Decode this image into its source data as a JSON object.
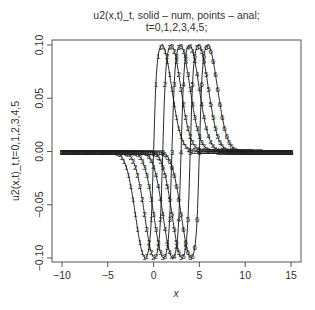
{
  "chart_data": {
    "type": "line",
    "title": "u2(x,t)_t, solid – num, points – anal;",
    "subtitle": "t=0,1,2,3,4,5;",
    "xlabel": "x",
    "ylabel": "u2(x,t)_t,t=0,1,2,3,4,5",
    "xlim": [
      -11.1,
      16.1
    ],
    "ylim": [
      -0.105,
      0.105
    ],
    "xticks": [
      -10,
      -5,
      0,
      5,
      10,
      15
    ],
    "xtick_labels": [
      "−10",
      "−5",
      "0",
      "5",
      "10",
      "15"
    ],
    "yticks": [
      0.1,
      0.05,
      0.0,
      -0.05,
      -0.1
    ],
    "ytick_labels": [
      "0.10",
      "0.05",
      "0.00",
      "−0.05",
      "−0.10"
    ],
    "grid": false,
    "legend": "none",
    "series": [
      {
        "name": "t=0",
        "marker": "1",
        "shift": 0,
        "min": {
          "x": -0.8,
          "y": -0.1
        },
        "max": {
          "x": 0.8,
          "y": 0.1
        }
      },
      {
        "name": "t=1",
        "marker": "2",
        "shift": 1,
        "min": {
          "x": 0.2,
          "y": -0.1
        },
        "max": {
          "x": 1.8,
          "y": 0.1
        }
      },
      {
        "name": "t=2",
        "marker": "3",
        "shift": 2,
        "min": {
          "x": 1.2,
          "y": -0.1
        },
        "max": {
          "x": 2.8,
          "y": 0.1
        }
      },
      {
        "name": "t=3",
        "marker": "4",
        "shift": 3,
        "min": {
          "x": 2.2,
          "y": -0.1
        },
        "max": {
          "x": 3.8,
          "y": 0.1
        }
      },
      {
        "name": "t=4",
        "marker": "5",
        "shift": 4,
        "min": {
          "x": 3.2,
          "y": -0.1
        },
        "max": {
          "x": 4.8,
          "y": 0.1
        }
      },
      {
        "name": "t=5",
        "marker": "6",
        "shift": 5,
        "min": {
          "x": 4.2,
          "y": -0.1
        },
        "max": {
          "x": 5.8,
          "y": 0.1
        }
      }
    ]
  }
}
